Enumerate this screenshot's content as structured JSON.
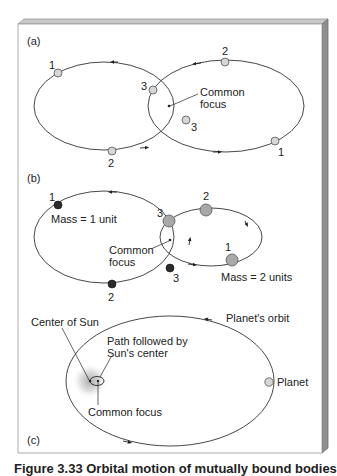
{
  "panels": {
    "a": {
      "label": "(a)",
      "focus_label_line1": "Common",
      "focus_label_line2": "focus",
      "left_body_positions": [
        "1",
        "2",
        "3"
      ],
      "right_body_positions": [
        "1",
        "2",
        "3"
      ]
    },
    "b": {
      "label": "(b)",
      "focus_label_line1": "Common",
      "focus_label_line2": "focus",
      "left_body_positions": [
        "1",
        "2",
        "3"
      ],
      "right_body_positions": [
        "1",
        "2",
        "3"
      ],
      "left_mass_label": "Mass = 1 unit",
      "right_mass_label": "Mass = 2 units"
    },
    "c": {
      "label": "(c)",
      "center_of_sun_label": "Center of Sun",
      "sun_path_label_line1": "Path followed by",
      "sun_path_label_line2": "Sun's center",
      "common_focus_label": "Common focus",
      "planet_orbit_label": "Planet's orbit",
      "planet_label": "Planet"
    }
  },
  "caption": "Figure 3.33 Orbital motion of mutually bound bodies",
  "colors": {
    "light_body": "#d6d6d6",
    "mid_body": "#a8a8a8",
    "dark_body": "#2b2b2b",
    "orbit_line": "#333333",
    "frame_side": "#8c8c8c",
    "frame_top": "#bdbdbd"
  }
}
